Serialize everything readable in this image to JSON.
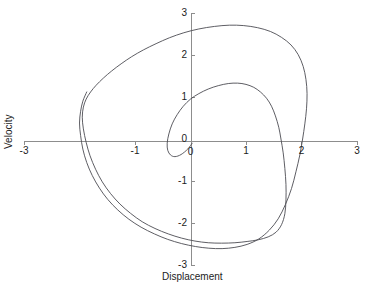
{
  "chart_data": {
    "type": "line",
    "title": "",
    "xlabel": "Displacement",
    "ylabel": "Velocity",
    "xlim": [
      -3,
      3
    ],
    "ylim": [
      -3,
      3
    ],
    "xticks": [
      -3,
      -1,
      0,
      1,
      2,
      3
    ],
    "yticks": [
      3,
      2,
      1,
      0,
      -1,
      -2,
      -3
    ],
    "xtick_labels": [
      "-3",
      "-1",
      "0",
      "1",
      "2",
      "3"
    ],
    "ytick_labels": [
      "3",
      "2",
      "1",
      "0",
      "-1",
      "-2",
      "-3"
    ],
    "grid": false,
    "legend": false,
    "axes_style": "crossed-at-origin",
    "series": [
      {
        "name": "trajectory",
        "color": "#4c4c52",
        "points": [
          [
            0.03,
            -0.1
          ],
          [
            -0.05,
            -0.24
          ],
          [
            -0.17,
            -0.37
          ],
          [
            -0.28,
            -0.42
          ],
          [
            -0.36,
            -0.38
          ],
          [
            -0.41,
            -0.27
          ],
          [
            -0.42,
            -0.1
          ],
          [
            -0.39,
            0.12
          ],
          [
            -0.33,
            0.36
          ],
          [
            -0.24,
            0.58
          ],
          [
            -0.13,
            0.78
          ],
          [
            0.0,
            0.95
          ],
          [
            0.15,
            1.08
          ],
          [
            0.32,
            1.19
          ],
          [
            0.5,
            1.27
          ],
          [
            0.68,
            1.32
          ],
          [
            0.85,
            1.33
          ],
          [
            1.0,
            1.3
          ],
          [
            1.14,
            1.23
          ],
          [
            1.26,
            1.12
          ],
          [
            1.37,
            0.97
          ],
          [
            1.46,
            0.78
          ],
          [
            1.53,
            0.55
          ],
          [
            1.59,
            0.28
          ],
          [
            1.63,
            0.0
          ],
          [
            1.67,
            -0.33
          ],
          [
            1.7,
            -0.7
          ],
          [
            1.72,
            -1.08
          ],
          [
            1.72,
            -1.45
          ],
          [
            1.7,
            -1.78
          ],
          [
            1.64,
            -2.04
          ],
          [
            1.54,
            -2.22
          ],
          [
            1.4,
            -2.33
          ],
          [
            1.22,
            -2.4
          ],
          [
            1.02,
            -2.44
          ],
          [
            0.8,
            -2.47
          ],
          [
            0.56,
            -2.48
          ],
          [
            0.32,
            -2.47
          ],
          [
            0.08,
            -2.43
          ],
          [
            -0.16,
            -2.36
          ],
          [
            -0.4,
            -2.26
          ],
          [
            -0.64,
            -2.13
          ],
          [
            -0.87,
            -1.97
          ],
          [
            -1.08,
            -1.77
          ],
          [
            -1.27,
            -1.55
          ],
          [
            -1.44,
            -1.3
          ],
          [
            -1.59,
            -1.02
          ],
          [
            -1.71,
            -0.72
          ],
          [
            -1.81,
            -0.4
          ],
          [
            -1.88,
            -0.08
          ],
          [
            -1.93,
            0.24
          ],
          [
            -1.95,
            0.52
          ],
          [
            -1.93,
            0.76
          ],
          [
            -1.88,
            0.95
          ],
          [
            -1.8,
            1.12
          ],
          [
            -1.7,
            1.28
          ],
          [
            -1.57,
            1.45
          ],
          [
            -1.42,
            1.62
          ],
          [
            -1.25,
            1.79
          ],
          [
            -1.06,
            1.96
          ],
          [
            -0.85,
            2.12
          ],
          [
            -0.62,
            2.27
          ],
          [
            -0.38,
            2.41
          ],
          [
            -0.12,
            2.53
          ],
          [
            0.15,
            2.62
          ],
          [
            0.43,
            2.68
          ],
          [
            0.7,
            2.71
          ],
          [
            0.96,
            2.7
          ],
          [
            1.21,
            2.65
          ],
          [
            1.44,
            2.56
          ],
          [
            1.64,
            2.42
          ],
          [
            1.81,
            2.24
          ],
          [
            1.94,
            2.01
          ],
          [
            2.03,
            1.73
          ],
          [
            2.08,
            1.42
          ],
          [
            2.1,
            1.08
          ],
          [
            2.09,
            0.72
          ],
          [
            2.06,
            0.36
          ],
          [
            2.02,
            0.0
          ],
          [
            1.97,
            -0.38
          ],
          [
            1.9,
            -0.78
          ],
          [
            1.82,
            -1.18
          ],
          [
            1.71,
            -1.56
          ],
          [
            1.58,
            -1.9
          ],
          [
            1.42,
            -2.17
          ],
          [
            1.23,
            -2.38
          ],
          [
            1.02,
            -2.51
          ],
          [
            0.8,
            -2.58
          ],
          [
            0.57,
            -2.61
          ],
          [
            0.33,
            -2.6
          ],
          [
            0.09,
            -2.56
          ],
          [
            -0.16,
            -2.49
          ],
          [
            -0.41,
            -2.39
          ],
          [
            -0.65,
            -2.26
          ],
          [
            -0.89,
            -2.1
          ],
          [
            -1.11,
            -1.91
          ],
          [
            -1.31,
            -1.69
          ],
          [
            -1.49,
            -1.44
          ],
          [
            -1.64,
            -1.17
          ],
          [
            -1.77,
            -0.87
          ],
          [
            -1.87,
            -0.56
          ],
          [
            -1.94,
            -0.24
          ],
          [
            -1.98,
            0.08
          ],
          [
            -2.0,
            0.38
          ],
          [
            -1.98,
            0.66
          ],
          [
            -1.94,
            0.9
          ],
          [
            -1.87,
            1.12
          ]
        ]
      }
    ]
  },
  "axis_color": "#8d8d8d",
  "curve_color": "#4c4c52",
  "text_color": "#1c1c1c"
}
